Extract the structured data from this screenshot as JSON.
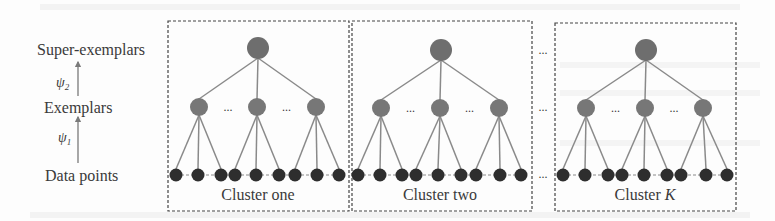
{
  "diagram": {
    "type": "hierarchical-clustering",
    "levels": [
      {
        "id": "super",
        "label": "Super-exemplars",
        "y": 50
      },
      {
        "id": "exemplar",
        "label": "Exemplars",
        "y": 108
      },
      {
        "id": "data",
        "label": "Data points",
        "y": 175
      }
    ],
    "mappings": [
      {
        "label": "ψ",
        "subscript": "2",
        "from": "exemplar",
        "to": "super"
      },
      {
        "label": "ψ",
        "subscript": "1",
        "from": "data",
        "to": "exemplar"
      }
    ],
    "between_clusters_ellipsis": "...",
    "within_level_ellipsis": "...",
    "clusters": [
      {
        "label": "Cluster one",
        "label_italic_part": "",
        "box": {
          "x": 168,
          "y": 21,
          "w": 181,
          "h": 190
        },
        "super": {
          "x": 258,
          "y": 48
        },
        "exemplars": [
          199,
          257,
          316
        ],
        "exemplar_y": 107,
        "points": [
          [
            176,
            198,
            221
          ],
          [
            235,
            256,
            279
          ],
          [
            295,
            317,
            339
          ]
        ],
        "point_y": 175,
        "label_x": 258
      },
      {
        "label": "Cluster two",
        "label_italic_part": "",
        "box": {
          "x": 352,
          "y": 21,
          "w": 180,
          "h": 190
        },
        "super": {
          "x": 441,
          "y": 50
        },
        "exemplars": [
          381,
          440,
          499
        ],
        "exemplar_y": 108,
        "points": [
          [
            358,
            380,
            402
          ],
          [
            416,
            438,
            461
          ],
          [
            476,
            500,
            521
          ]
        ],
        "point_y": 175,
        "label_x": 440
      },
      {
        "label": "Cluster ",
        "label_italic_part": "K",
        "box": {
          "x": 555,
          "y": 23,
          "w": 181,
          "h": 188
        },
        "super": {
          "x": 646,
          "y": 50
        },
        "exemplars": [
          586,
          645,
          703
        ],
        "exemplar_y": 108,
        "points": [
          [
            563,
            585,
            608
          ],
          [
            622,
            644,
            667
          ],
          [
            681,
            706,
            727
          ]
        ],
        "point_y": 175,
        "label_x": 645
      }
    ],
    "colors": {
      "super_node": "#6e6e6e",
      "exemplar_node": "#777777",
      "data_node": "#2e2e2e",
      "edge": "#8a8a8a",
      "box_border": "#444444",
      "text": "#3a3a3a"
    }
  }
}
